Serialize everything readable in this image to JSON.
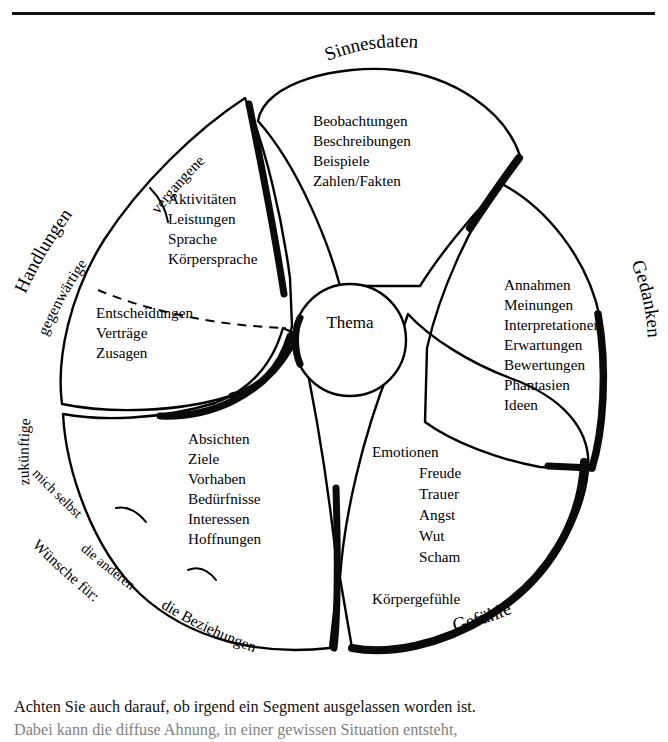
{
  "document": {
    "type": "worksheet-figure",
    "has_top_rule": true,
    "ink_color": "#000000",
    "background_color": "#ffffff"
  },
  "figure": {
    "center": {
      "label": "Thema"
    },
    "segments": [
      {
        "id": "sinnesdaten",
        "outer_label": "Sinnesdaten",
        "items": [
          "Beobachtungen",
          "Beschreibungen",
          "Beispiele",
          "Zahlen/Fakten"
        ],
        "sub_labels": []
      },
      {
        "id": "gedanken",
        "outer_label": "Gedanken",
        "items": [
          "Annahmen",
          "Meinungen",
          "Interpretationen",
          "Erwartungen",
          "Bewertungen",
          "Phantasien",
          "Ideen"
        ],
        "sub_labels": []
      },
      {
        "id": "gefuehle",
        "outer_label": "Gefühle",
        "items": [
          "Emotionen",
          "Freude",
          "Trauer",
          "Angst",
          "Wut",
          "Scham"
        ],
        "items_extra": [
          "Körpergefühle"
        ],
        "sub_labels": []
      },
      {
        "id": "wuensche",
        "outer_label": "Wünsche für:",
        "items": [
          "Absichten",
          "Ziele",
          "Vorhaben",
          "Bedürfnisse",
          "Interessen",
          "Hoffnungen"
        ],
        "sub_labels": [
          "mich selbst",
          "die anderen",
          "die Beziehungen"
        ]
      },
      {
        "id": "handlungen",
        "outer_label": "Handlungen",
        "items_upper": [
          "Aktivitäten",
          "Leistungen",
          "Sprache",
          "Körpersprache"
        ],
        "items_lower": [
          "Entscheidungen",
          "Verträge",
          "Zusagen"
        ],
        "sub_labels": [
          "vergangene",
          "gegenwärtige",
          "zukünftige"
        ]
      }
    ]
  },
  "caption": {
    "line1": "Achten Sie auch darauf, ob irgend ein Segment ausgelassen worden ist.",
    "line2": "Dabei kann die diffuse Ahnung, in einer gewissen Situation entsteht,"
  }
}
